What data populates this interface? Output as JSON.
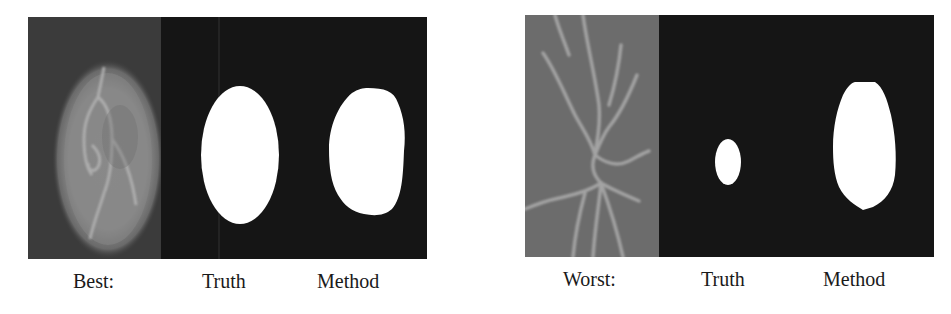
{
  "figures": [
    {
      "id": "best",
      "labels": {
        "case": "Best:",
        "truth": "Truth",
        "method": "Method"
      },
      "panel": {
        "x": 28,
        "y": 17,
        "width": 399,
        "height": 242
      },
      "photo": {
        "width": 133,
        "background": "#3b3b3b"
      },
      "truth_mask": {
        "cx": 212,
        "cy": 138,
        "rx": 39,
        "ry": 69
      },
      "method_mask": {
        "x_min": 301,
        "x_max": 376,
        "y_min": 71,
        "y_max": 199
      }
    },
    {
      "id": "worst",
      "labels": {
        "case": "Worst:",
        "truth": "Truth",
        "method": "Method"
      },
      "panel": {
        "x": 525,
        "y": 15,
        "width": 409,
        "height": 242
      },
      "photo": {
        "width": 134,
        "background": "#6c6c6c"
      },
      "truth_mask": {
        "cx": 203,
        "cy": 147,
        "rx": 13,
        "ry": 23
      },
      "method_mask": {
        "x_min": 308,
        "x_max": 370,
        "y_min": 67,
        "y_max": 195
      }
    }
  ],
  "colors": {
    "mask_background": "#151515",
    "mask_foreground": "#ffffff",
    "label_text": "#1a1a1a"
  }
}
